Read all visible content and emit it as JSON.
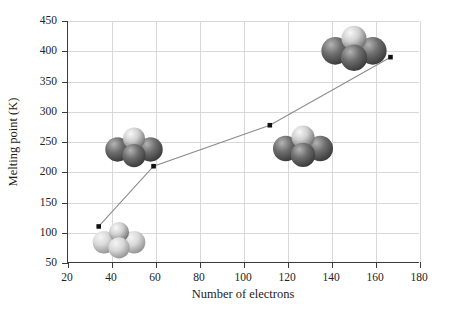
{
  "chart_data": {
    "type": "line",
    "title": "",
    "xlabel": "Number of electrons",
    "ylabel": "Melting point (K)",
    "xlim": [
      20,
      180
    ],
    "ylim": [
      50,
      450
    ],
    "xticks": [
      20,
      40,
      60,
      80,
      100,
      120,
      140,
      160,
      180
    ],
    "yticks": [
      50,
      100,
      150,
      200,
      250,
      300,
      350,
      400,
      450
    ],
    "grid": true,
    "legend": "none",
    "marker": "square",
    "marker_color": "#111111",
    "line_color": "#8c8c8c",
    "x": [
      34,
      59,
      112,
      167
    ],
    "y": [
      109,
      209,
      277,
      390
    ],
    "points": [
      {
        "x": 34,
        "y": 109
      },
      {
        "x": 59,
        "y": 209
      },
      {
        "x": 112,
        "y": 277
      },
      {
        "x": 167,
        "y": 390
      }
    ],
    "annotations": [
      {
        "name": "molecule-1",
        "x": 43,
        "y": 88,
        "shade": "light",
        "width": 56,
        "height": 42
      },
      {
        "name": "molecule-2",
        "x": 50,
        "y": 241,
        "shade": "dark",
        "width": 62,
        "height": 44
      },
      {
        "name": "molecule-3",
        "x": 127,
        "y": 244,
        "shade": "dark",
        "width": 68,
        "height": 46
      },
      {
        "name": "molecule-4",
        "x": 150,
        "y": 405,
        "shade": "dark",
        "width": 72,
        "height": 50
      }
    ]
  },
  "axes": {
    "y_tick_labels": [
      "450",
      "400",
      "350",
      "300",
      "250",
      "200",
      "150",
      "100",
      "50"
    ],
    "x_tick_labels": [
      "20",
      "40",
      "60",
      "80",
      "100",
      "120",
      "140",
      "160",
      "180"
    ],
    "y_title": "Melting point (K)",
    "x_title": "Number of electrons"
  },
  "colors": {
    "grid": "#d8d8d8",
    "axis": "#3b3b3b",
    "line": "#8c8c8c",
    "marker": "#111111",
    "text": "#232323",
    "background": "#ffffff"
  }
}
